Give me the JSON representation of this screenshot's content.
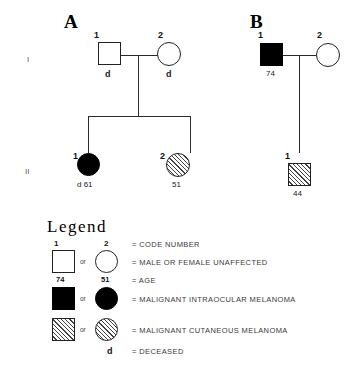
{
  "figure": {
    "background_color": "#ffffff",
    "line_color": "#2a2a2a",
    "symbol_fill_affected": "#000000",
    "symbol_fill_unaffected": "#ffffff",
    "hatch_color": "#444444"
  },
  "generation_labels": [
    {
      "id": "gen-1",
      "text": "I"
    },
    {
      "id": "gen-2",
      "text": "II"
    }
  ],
  "pedigrees": [
    {
      "letter": "A",
      "individuals": [
        {
          "id": "a-i-1",
          "code": "1",
          "sex": "male",
          "shape": "square",
          "status": "unaffected",
          "fill": "open",
          "caption": "d",
          "deceased": true,
          "age": ""
        },
        {
          "id": "a-i-2",
          "code": "2",
          "sex": "female",
          "shape": "circle",
          "status": "unaffected",
          "fill": "open",
          "caption": "d",
          "deceased": true,
          "age": ""
        },
        {
          "id": "a-ii-1",
          "code": "1",
          "sex": "female",
          "shape": "circle",
          "status": "malignant-intraocular-melanoma",
          "fill": "filled",
          "caption": "d 61",
          "deceased": true,
          "age": "61"
        },
        {
          "id": "a-ii-2",
          "code": "2",
          "sex": "female",
          "shape": "circle",
          "status": "malignant-cutaneous-melanoma",
          "fill": "hatched",
          "caption": "51",
          "deceased": false,
          "age": "51"
        }
      ]
    },
    {
      "letter": "B",
      "individuals": [
        {
          "id": "b-i-1",
          "code": "1",
          "sex": "male",
          "shape": "square",
          "status": "malignant-intraocular-melanoma",
          "fill": "filled",
          "caption": "74",
          "deceased": false,
          "age": "74"
        },
        {
          "id": "b-i-2",
          "code": "2",
          "sex": "female",
          "shape": "circle",
          "status": "unaffected",
          "fill": "open",
          "caption": "",
          "deceased": false,
          "age": ""
        },
        {
          "id": "b-ii-1",
          "code": "1",
          "sex": "male",
          "shape": "square",
          "status": "malignant-cutaneous-melanoma",
          "fill": "hatched",
          "caption": "44",
          "deceased": false,
          "age": "44"
        }
      ]
    }
  ],
  "legend": {
    "title": "Legend",
    "code_number_example_male": "1",
    "code_number_example_female": "2",
    "age_example_male": "74",
    "age_example_female": "51",
    "or_label": "or",
    "deceased_symbol": "d",
    "rows": [
      {
        "id": "legend-code-number",
        "text": "= CODE NUMBER"
      },
      {
        "id": "legend-unaffected",
        "text": "= MALE OR FEMALE UNAFFECTED"
      },
      {
        "id": "legend-age",
        "text": "= AGE"
      },
      {
        "id": "legend-intraocular",
        "text": "= MALIGNANT INTRAOCULAR MELANOMA"
      },
      {
        "id": "legend-cutaneous",
        "text": "= MALIGNANT CUTANEOUS MELANOMA"
      },
      {
        "id": "legend-deceased",
        "text": "= DECEASED"
      }
    ]
  }
}
